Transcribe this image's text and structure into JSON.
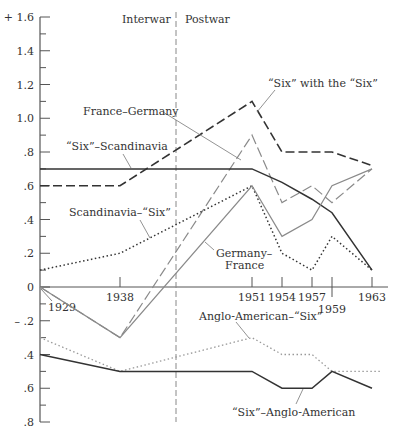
{
  "chart_data": {
    "type": "line",
    "title": "",
    "xlabel": "",
    "ylabel": "",
    "ylim": [
      -0.8,
      1.6
    ],
    "y_ticks": [
      {
        "value": 1.6,
        "label": "+ 1.6"
      },
      {
        "value": 1.4,
        "label": "1.4"
      },
      {
        "value": 1.2,
        "label": "1.2"
      },
      {
        "value": 1.0,
        "label": "1.0"
      },
      {
        "value": 0.8,
        "label": ".8"
      },
      {
        "value": 0.6,
        "label": ".6"
      },
      {
        "value": 0.4,
        "label": ".4"
      },
      {
        "value": 0.2,
        "label": ".2"
      },
      {
        "value": 0,
        "label": "0"
      },
      {
        "value": -0.2,
        "label": "– .2"
      },
      {
        "value": -0.4,
        "label": ".4"
      },
      {
        "value": -0.6,
        "label": ".6"
      },
      {
        "value": -0.8,
        "label": ".8"
      }
    ],
    "x_ticks": [
      {
        "year": 1929,
        "label": "1929"
      },
      {
        "year": 1938,
        "label": "1938"
      },
      {
        "year": 1951,
        "label": "1951"
      },
      {
        "year": 1954,
        "label": "1954"
      },
      {
        "year": 1957,
        "label": "1957"
      },
      {
        "year": 1959,
        "label": "1959"
      },
      {
        "year": 1963,
        "label": "1963"
      }
    ],
    "grid": false,
    "legend_position": "inline labels",
    "periods": [
      {
        "label": "Interwar"
      },
      {
        "label": "Postwar"
      }
    ],
    "divider_year": 1944.5,
    "series": [
      {
        "name": "“Six” with the “Six”",
        "style": "long-dash-dark",
        "points": [
          [
            1929,
            0.6
          ],
          [
            1938,
            0.6
          ],
          [
            1951,
            1.1
          ],
          [
            1954,
            0.8
          ],
          [
            1957,
            0.8
          ],
          [
            1959,
            0.8
          ],
          [
            1963,
            0.72
          ]
        ]
      },
      {
        "name": "France–Germany",
        "style": "dash-gray",
        "points": [
          [
            1929,
            0.0
          ],
          [
            1938,
            -0.3
          ],
          [
            1951,
            0.9
          ],
          [
            1954,
            0.5
          ],
          [
            1957,
            0.6
          ],
          [
            1959,
            0.5
          ],
          [
            1963,
            0.7
          ]
        ]
      },
      {
        "name": "“Six”–Scandinavia",
        "style": "solid-dark",
        "points": [
          [
            1929,
            0.7
          ],
          [
            1938,
            0.7
          ],
          [
            1951,
            0.7
          ],
          [
            1954,
            0.62
          ],
          [
            1957,
            0.52
          ],
          [
            1959,
            0.44
          ],
          [
            1963,
            0.1
          ]
        ]
      },
      {
        "name": "Scandinavia–“Six”",
        "style": "dotted-dark",
        "points": [
          [
            1929,
            0.1
          ],
          [
            1938,
            0.2
          ],
          [
            1951,
            0.6
          ],
          [
            1954,
            0.2
          ],
          [
            1957,
            0.1
          ],
          [
            1959,
            0.3
          ],
          [
            1963,
            0.1
          ]
        ]
      },
      {
        "name": "Germany–France",
        "style": "solid-gray",
        "points": [
          [
            1929,
            0.0
          ],
          [
            1938,
            -0.3
          ],
          [
            1951,
            0.6
          ],
          [
            1954,
            0.3
          ],
          [
            1957,
            0.4
          ],
          [
            1959,
            0.6
          ],
          [
            1963,
            0.7
          ]
        ]
      },
      {
        "name": "Anglo-American–“Six”",
        "style": "dotted-gray",
        "points": [
          [
            1929,
            -0.3
          ],
          [
            1938,
            -0.5
          ],
          [
            1951,
            -0.3
          ],
          [
            1954,
            -0.4
          ],
          [
            1957,
            -0.4
          ],
          [
            1959,
            -0.5
          ],
          [
            1963,
            -0.5
          ]
        ]
      },
      {
        "name": "“Six”–Anglo-American",
        "style": "solid-dark",
        "points": [
          [
            1929,
            -0.4
          ],
          [
            1938,
            -0.5
          ],
          [
            1951,
            -0.5
          ],
          [
            1954,
            -0.6
          ],
          [
            1957,
            -0.6
          ],
          [
            1959,
            -0.5
          ],
          [
            1963,
            -0.6
          ]
        ]
      }
    ]
  },
  "labels": {
    "interwar": "Interwar",
    "postwar": "Postwar",
    "six_with_six": "“Six” with the “Six”",
    "france_germany": "France–Germany",
    "six_scandinavia": "“Six”–Scandinavia",
    "scandinavia_six": "Scandinavia–“Six”",
    "germany_france_1": "Germany–",
    "germany_france_2": "France",
    "anglo_six": "Anglo-American–“Six”",
    "six_anglo": "“Six”–Anglo-American"
  }
}
